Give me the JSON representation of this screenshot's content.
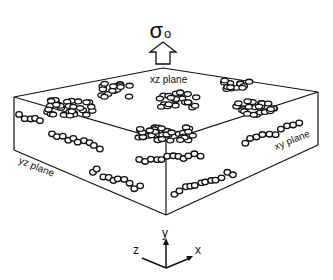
{
  "title": {
    "stress_symbol": "σ",
    "stress_subscript": "o"
  },
  "planes": {
    "xz": "xz plane",
    "yz": "yz plane",
    "xy": "xy plane"
  },
  "axes": {
    "x": "x",
    "y": "y",
    "z": "z"
  },
  "colors": {
    "line": "#111111",
    "background": "#ffffff"
  }
}
